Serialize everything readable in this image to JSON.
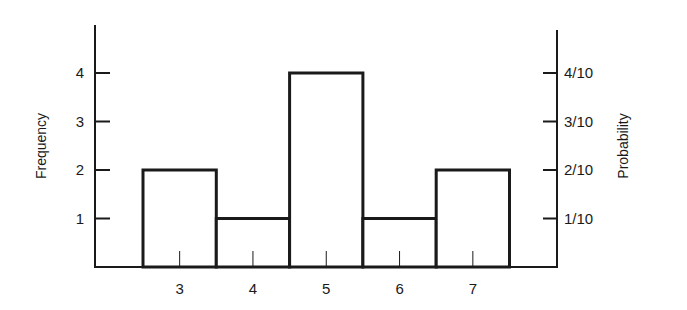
{
  "chart_data": {
    "type": "bar",
    "subtype": "histogram",
    "title": "",
    "xlabel": "",
    "ylabel": "Frequency",
    "ylabel_right": "Probability",
    "categories": [
      "3",
      "4",
      "5",
      "6",
      "7"
    ],
    "values": [
      2,
      1,
      4,
      1,
      2
    ],
    "probabilities": [
      "2/10",
      "1/10",
      "4/10",
      "1/10",
      "2/10"
    ],
    "y_ticks": [
      "1",
      "2",
      "3",
      "4"
    ],
    "y_ticks_right": [
      "1/10",
      "2/10",
      "3/10",
      "4/10"
    ],
    "ylim": [
      0,
      5
    ],
    "grid": false,
    "legend": null,
    "bar_fill": "#ffffff",
    "bar_stroke": "#1a1a1a"
  }
}
